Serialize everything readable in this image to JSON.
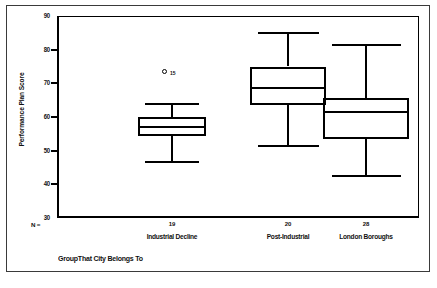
{
  "chart_data": {
    "type": "box",
    "title": "",
    "xlabel": "GroupThat City Belongs To",
    "ylabel": "Performance Plan Score",
    "ylim": [
      30,
      90
    ],
    "yticks": [
      30,
      40,
      50,
      60,
      70,
      80,
      90
    ],
    "ytick_labels": [
      "30",
      "40",
      "50",
      "60",
      "70",
      "80",
      "90"
    ],
    "grid": false,
    "legend": "none",
    "n_label": "N =",
    "categories": [
      "Industrial Decline",
      "Post-Industrial",
      "London Boroughs"
    ],
    "counts": [
      "19",
      "20",
      "28"
    ],
    "boxes": [
      {
        "category": "Industrial Decline",
        "n": "19",
        "whisker_low": 46.5,
        "q1": 54.5,
        "median": 57.0,
        "q3": 60.0,
        "whisker_high": 64.0,
        "outliers": [
          {
            "value": 73.5,
            "label": "15"
          }
        ]
      },
      {
        "category": "Post-Industrial",
        "n": "20",
        "whisker_low": 51.5,
        "q1": 63.5,
        "median": 68.5,
        "q3": 75.0,
        "whisker_high": 85.0,
        "outliers": []
      },
      {
        "category": "London Boroughs",
        "n": "28",
        "whisker_low": 42.5,
        "q1": 53.5,
        "median": 61.5,
        "q3": 65.5,
        "whisker_high": 81.5,
        "outliers": []
      }
    ]
  },
  "style": {
    "line_color": "#000000",
    "frame_color": "#3a3a3a",
    "background": "#ffffff"
  }
}
